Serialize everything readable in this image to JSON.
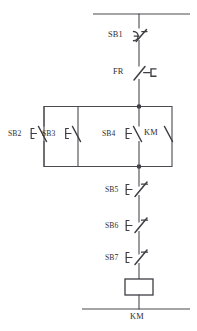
{
  "diagram": {
    "type": "electrical-schematic",
    "line_color": "#3d3d44",
    "background": "#ffffff",
    "caption": "",
    "rails": {
      "top_label": "",
      "bottom_label": ""
    },
    "components": [
      {
        "id": "SB1",
        "label": "SB1",
        "kind": "pushbutton-nc-mushroom",
        "description": "Emergency stop pushbutton, normally closed, mushroom head",
        "branch": "series-main",
        "order": 1
      },
      {
        "id": "FR",
        "label": "FR",
        "kind": "thermal-overload-nc",
        "description": "Thermal overload relay, normally closed contact",
        "branch": "series-main",
        "order": 2
      },
      {
        "id": "SB2",
        "label": "SB2",
        "kind": "pushbutton-no",
        "description": "Start pushbutton, normally open",
        "branch": "parallel",
        "order": 1
      },
      {
        "id": "SB3",
        "label": "SB3",
        "kind": "pushbutton-no",
        "description": "Start pushbutton, normally open",
        "branch": "parallel",
        "order": 2
      },
      {
        "id": "SB4",
        "label": "SB4",
        "kind": "pushbutton-no",
        "description": "Start pushbutton, normally open",
        "branch": "parallel",
        "order": 3
      },
      {
        "id": "KM-aux",
        "label": "KM",
        "kind": "contact-no",
        "description": "KM auxiliary holding contact, normally open",
        "branch": "parallel",
        "order": 4
      },
      {
        "id": "SB5",
        "label": "SB5",
        "kind": "pushbutton-nc",
        "description": "Stop pushbutton, normally closed",
        "branch": "series-main",
        "order": 3
      },
      {
        "id": "SB6",
        "label": "SB6",
        "kind": "pushbutton-nc",
        "description": "Stop pushbutton, normally closed",
        "branch": "series-main",
        "order": 4
      },
      {
        "id": "SB7",
        "label": "SB7",
        "kind": "pushbutton-nc",
        "description": "Stop pushbutton, normally closed",
        "branch": "series-main",
        "order": 5
      },
      {
        "id": "KM-coil",
        "label": "KM",
        "kind": "contactor-coil",
        "description": "Contactor coil KM",
        "branch": "series-main",
        "order": 6
      }
    ],
    "labels": {
      "sb1": "SB1",
      "fr": "FR",
      "sb2": "SB2",
      "sb3": "SB3",
      "sb4": "SB4",
      "km_aux": "KM",
      "sb5": "SB5",
      "sb6": "SB6",
      "sb7": "SB7",
      "km_coil": "KM"
    }
  }
}
